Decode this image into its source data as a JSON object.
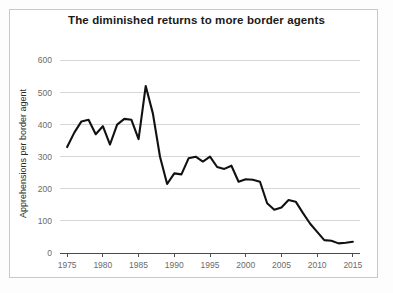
{
  "chart_data": {
    "type": "line",
    "title": "The diminished returns to more border agents",
    "xlabel": "",
    "ylabel": "Apprehensions per border agent",
    "xlim": [
      1974,
      2016
    ],
    "ylim": [
      0,
      620
    ],
    "grid": true,
    "legend": "none",
    "xticks": [
      1975,
      1980,
      1985,
      1990,
      1995,
      2000,
      2005,
      2010,
      2015
    ],
    "xticklabels": [
      "1975",
      "1980",
      "1985",
      "1990",
      "1995",
      "2000",
      "2005",
      "2010",
      "2015"
    ],
    "yticks": [
      0,
      100,
      200,
      300,
      400,
      500,
      600
    ],
    "yticklabels": [
      "0",
      "100",
      "200",
      "300",
      "400",
      "500",
      "600"
    ],
    "series": [
      {
        "name": "Apprehensions per border agent",
        "color": "#111111",
        "x": [
          1975,
          1976,
          1977,
          1978,
          1979,
          1980,
          1981,
          1982,
          1983,
          1984,
          1985,
          1986,
          1987,
          1988,
          1989,
          1990,
          1991,
          1992,
          1993,
          1994,
          1995,
          1996,
          1997,
          1998,
          1999,
          2000,
          2001,
          2002,
          2003,
          2004,
          2005,
          2006,
          2007,
          2008,
          2009,
          2010,
          2011,
          2012,
          2013,
          2014,
          2015
        ],
        "y": [
          330,
          375,
          410,
          415,
          370,
          395,
          338,
          400,
          418,
          415,
          355,
          520,
          435,
          300,
          215,
          248,
          245,
          295,
          300,
          285,
          300,
          268,
          262,
          272,
          222,
          230,
          228,
          222,
          155,
          135,
          142,
          165,
          160,
          125,
          92,
          66,
          40,
          38,
          30,
          32,
          35
        ]
      }
    ]
  },
  "plot_geometry": {
    "left": 60,
    "right": 360,
    "top": 54,
    "bottom": 253
  }
}
